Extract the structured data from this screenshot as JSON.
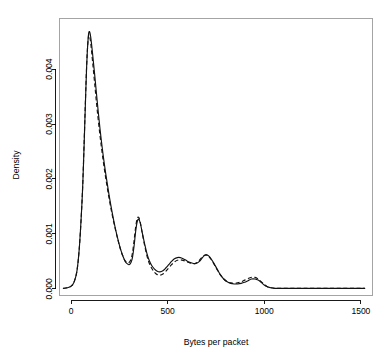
{
  "chart_data": {
    "type": "line",
    "title": "",
    "subtitle": "",
    "xlabel": "Bytes per packet",
    "ylabel": "Density",
    "xlim": [
      -60,
      1560
    ],
    "ylim": [
      -0.00012,
      0.00492
    ],
    "grid": false,
    "legend": "none",
    "xticks": [
      0,
      500,
      1000,
      1500
    ],
    "xtick_labels": [
      "0",
      "500",
      "1000",
      "1500"
    ],
    "yticks": [
      0.0,
      0.001,
      0.002,
      0.003,
      0.004
    ],
    "ytick_labels": [
      "0.000",
      "0.001",
      "0.002",
      "0.003",
      "0.004"
    ],
    "annotations": [],
    "series": [
      {
        "name": "solid",
        "style": "solid",
        "x": [
          -40,
          -20,
          0,
          15,
          30,
          42,
          52,
          60,
          68,
          74,
          80,
          86,
          92,
          100,
          110,
          122,
          135,
          150,
          165,
          180,
          196,
          212,
          228,
          244,
          258,
          270,
          280,
          290,
          300,
          310,
          318,
          326,
          334,
          342,
          350,
          358,
          368,
          380,
          392,
          404,
          418,
          432,
          446,
          460,
          475,
          490,
          505,
          520,
          535,
          550,
          565,
          580,
          595,
          610,
          625,
          640,
          652,
          664,
          676,
          688,
          700,
          712,
          726,
          740,
          756,
          772,
          790,
          808,
          826,
          844,
          862,
          880,
          898,
          916,
          934,
          952,
          968,
          984,
          1000,
          1016,
          1034,
          1055,
          1080,
          1110,
          1150,
          1200,
          1260,
          1330,
          1400,
          1470,
          1520
        ],
        "y": [
          1e-05,
          2e-05,
          5e-05,
          0.00012,
          0.00032,
          0.00072,
          0.00128,
          0.00186,
          0.00268,
          0.00336,
          0.004,
          0.00444,
          0.00467,
          0.00462,
          0.00432,
          0.0039,
          0.00342,
          0.0029,
          0.00246,
          0.00208,
          0.00172,
          0.0014,
          0.00112,
          0.00088,
          0.0007,
          0.00058,
          0.0005,
          0.00046,
          0.00044,
          0.00048,
          0.00058,
          0.00078,
          0.00104,
          0.00122,
          0.00127,
          0.0012,
          0.00103,
          0.00083,
          0.00065,
          0.00052,
          0.00042,
          0.00036,
          0.00032,
          0.00031,
          0.00033,
          0.00038,
          0.00044,
          0.0005,
          0.00055,
          0.00057,
          0.00057,
          0.00055,
          0.00052,
          0.00049,
          0.00047,
          0.00046,
          0.00047,
          0.0005,
          0.00055,
          0.0006,
          0.00062,
          0.0006,
          0.00054,
          0.00046,
          0.00036,
          0.00026,
          0.00018,
          0.00013,
          0.0001,
          9e-05,
          9e-05,
          0.0001,
          0.00012,
          0.00015,
          0.00018,
          0.00018,
          0.00016,
          0.00012,
          7e-05,
          4e-05,
          2e-05,
          1e-05,
          1e-05,
          1e-05,
          1e-05,
          1e-05,
          1e-05,
          1e-05,
          1e-05,
          1e-05,
          1e-05
        ]
      },
      {
        "name": "dashed",
        "style": "dashed",
        "x": [
          -40,
          -20,
          0,
          15,
          30,
          42,
          52,
          60,
          68,
          74,
          80,
          86,
          92,
          100,
          110,
          122,
          135,
          150,
          165,
          180,
          196,
          212,
          228,
          244,
          258,
          270,
          280,
          290,
          300,
          310,
          318,
          326,
          334,
          342,
          350,
          358,
          368,
          380,
          392,
          404,
          418,
          432,
          446,
          460,
          475,
          490,
          505,
          520,
          535,
          550,
          565,
          580,
          595,
          610,
          625,
          640,
          652,
          664,
          676,
          688,
          700,
          712,
          726,
          740,
          756,
          772,
          790,
          808,
          826,
          844,
          862,
          880,
          898,
          916,
          934,
          952,
          968,
          984,
          1000,
          1016,
          1034,
          1055,
          1080,
          1110,
          1150,
          1200,
          1260,
          1330,
          1400,
          1470,
          1520
        ],
        "y": [
          1e-05,
          2e-05,
          5e-05,
          0.00012,
          0.00032,
          0.00072,
          0.00128,
          0.00188,
          0.00272,
          0.0034,
          0.00402,
          0.00444,
          0.00462,
          0.00452,
          0.00418,
          0.00374,
          0.00326,
          0.00278,
          0.00236,
          0.002,
          0.00166,
          0.00136,
          0.0011,
          0.00087,
          0.00069,
          0.00058,
          0.00051,
          0.00048,
          0.00048,
          0.00054,
          0.00066,
          0.00088,
          0.00112,
          0.00128,
          0.0013,
          0.00121,
          0.00102,
          0.0008,
          0.00061,
          0.00047,
          0.00037,
          0.0003,
          0.00026,
          0.00025,
          0.00027,
          0.00032,
          0.00038,
          0.00044,
          0.00049,
          0.00052,
          0.00053,
          0.00052,
          0.0005,
          0.00048,
          0.00046,
          0.00046,
          0.00048,
          0.00052,
          0.00057,
          0.00061,
          0.00062,
          0.00059,
          0.00053,
          0.00045,
          0.00035,
          0.00026,
          0.00018,
          0.00013,
          0.00011,
          0.0001,
          0.00011,
          0.00013,
          0.00016,
          0.00019,
          0.00021,
          0.00021,
          0.00018,
          0.00013,
          8e-05,
          4e-05,
          2e-05,
          1e-05,
          1e-05,
          1e-05,
          1e-05,
          1e-05,
          1e-05,
          1e-05,
          1e-05,
          1e-05,
          1e-05
        ]
      }
    ]
  }
}
